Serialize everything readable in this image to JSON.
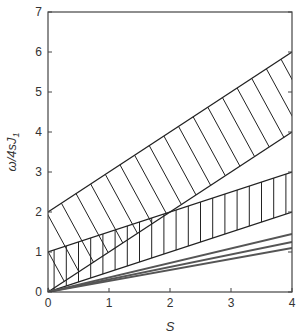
{
  "chart_data": {
    "type": "line",
    "title": "",
    "xlabel": "S",
    "ylabel": "ω/4sJ",
    "ylabel_subscript": "1",
    "xlim": [
      0,
      4
    ],
    "ylim": [
      0,
      7
    ],
    "grid": false,
    "legend": null,
    "xticks": [
      0,
      1,
      2,
      3,
      4
    ],
    "yticks": [
      0,
      1,
      2,
      3,
      4,
      5,
      6,
      7
    ],
    "bands": [
      {
        "name": "upper-band",
        "hatch": "diagonal",
        "upper": {
          "x": [
            0,
            4
          ],
          "y": [
            2,
            6
          ]
        },
        "lower": {
          "x": [
            0,
            4
          ],
          "y": [
            0,
            4
          ]
        },
        "color": "#222222"
      },
      {
        "name": "lower-band",
        "hatch": "vertical",
        "upper": {
          "x": [
            0,
            4
          ],
          "y": [
            1,
            3
          ]
        },
        "lower": {
          "x": [
            0,
            4
          ],
          "y": [
            0,
            2
          ]
        },
        "color": "#222222"
      }
    ],
    "series": [
      {
        "name": "line-1",
        "x": [
          0,
          4
        ],
        "y": [
          0,
          1.45
        ],
        "color": "#555555"
      },
      {
        "name": "line-2",
        "x": [
          0,
          4
        ],
        "y": [
          0,
          1.25
        ],
        "color": "#555555"
      },
      {
        "name": "line-3",
        "x": [
          0,
          4
        ],
        "y": [
          0,
          1.1
        ],
        "color": "#555555"
      }
    ]
  }
}
